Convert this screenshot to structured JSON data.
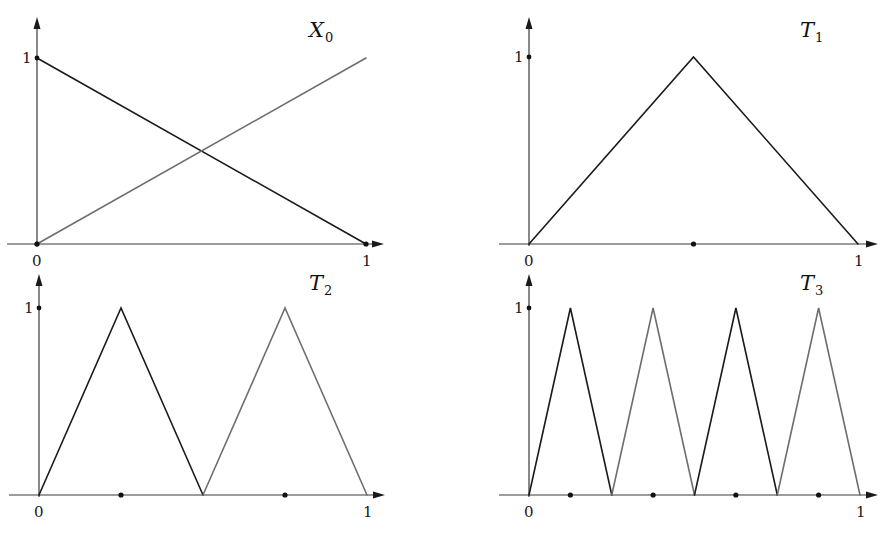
{
  "figure": {
    "colors": {
      "primary_curve": "#1a1a1a",
      "secondary_curve": "#6e6e6e",
      "axis": "#3a3a3a",
      "background": "#ffffff"
    }
  },
  "panels": [
    {
      "id": "X0",
      "title": "X",
      "title_sub": "0",
      "origin_label": "0",
      "x_end_label": "1",
      "y_tick_label": "1",
      "frame": {
        "x0": 37,
        "y0": 244,
        "x1": 366,
        "y1": 58,
        "axis_top": 17,
        "axis_right": 384
      },
      "title_pos": {
        "x": 309,
        "y": 37
      },
      "curves": [
        {
          "name": "decreasing-line",
          "color_key": "primary_curve",
          "points": [
            [
              0,
              1
            ],
            [
              1,
              0
            ]
          ]
        },
        {
          "name": "increasing-line",
          "color_key": "secondary_curve",
          "points": [
            [
              0,
              0
            ],
            [
              1,
              1
            ]
          ]
        }
      ],
      "x_dots": [
        0,
        1
      ],
      "y_dots": [
        0,
        1
      ]
    },
    {
      "id": "T1",
      "title": "T",
      "title_sub": "1",
      "origin_label": "0",
      "x_end_label": "1",
      "y_tick_label": "1",
      "frame": {
        "x0": 529,
        "y0": 244,
        "x1": 858,
        "y1": 57,
        "axis_top": 17,
        "axis_right": 878
      },
      "title_pos": {
        "x": 800,
        "y": 37
      },
      "curves": [
        {
          "name": "tent-1",
          "color_key": "primary_curve",
          "points": [
            [
              0,
              0
            ],
            [
              0.5,
              1
            ],
            [
              1,
              0
            ]
          ]
        }
      ],
      "x_dots": [
        0.5
      ],
      "y_dots": [
        1
      ]
    },
    {
      "id": "T2",
      "title": "T",
      "title_sub": "2",
      "origin_label": "0",
      "x_end_label": "1",
      "y_tick_label": "1",
      "frame": {
        "x0": 39,
        "y0": 495,
        "x1": 367,
        "y1": 308,
        "axis_top": 274,
        "axis_right": 385
      },
      "title_pos": {
        "x": 309,
        "y": 290
      },
      "curves": [
        {
          "name": "tent-2a",
          "color_key": "primary_curve",
          "points": [
            [
              0,
              0
            ],
            [
              0.25,
              1
            ],
            [
              0.5,
              0
            ]
          ]
        },
        {
          "name": "tent-2b",
          "color_key": "secondary_curve",
          "points": [
            [
              0.5,
              0
            ],
            [
              0.75,
              1
            ],
            [
              1,
              0
            ]
          ]
        }
      ],
      "x_dots": [
        0.25,
        0.75
      ],
      "y_dots": [
        1
      ]
    },
    {
      "id": "T3",
      "title": "T",
      "title_sub": "3",
      "origin_label": "0",
      "x_end_label": "1",
      "y_tick_label": "1",
      "frame": {
        "x0": 529,
        "y0": 495,
        "x1": 860,
        "y1": 308,
        "axis_top": 274,
        "axis_right": 878
      },
      "title_pos": {
        "x": 800,
        "y": 290
      },
      "curves": [
        {
          "name": "tent-3a",
          "color_key": "primary_curve",
          "points": [
            [
              0,
              0
            ],
            [
              0.125,
              1
            ],
            [
              0.25,
              0
            ]
          ]
        },
        {
          "name": "tent-3b",
          "color_key": "secondary_curve",
          "points": [
            [
              0.25,
              0
            ],
            [
              0.375,
              1
            ],
            [
              0.5,
              0
            ]
          ]
        },
        {
          "name": "tent-3c",
          "color_key": "primary_curve",
          "points": [
            [
              0.5,
              0
            ],
            [
              0.625,
              1
            ],
            [
              0.75,
              0
            ]
          ]
        },
        {
          "name": "tent-3d",
          "color_key": "secondary_curve",
          "points": [
            [
              0.75,
              0
            ],
            [
              0.875,
              1
            ],
            [
              1,
              0
            ]
          ]
        }
      ],
      "x_dots": [
        0.125,
        0.375,
        0.625,
        0.875
      ],
      "y_dots": [
        1
      ]
    }
  ]
}
